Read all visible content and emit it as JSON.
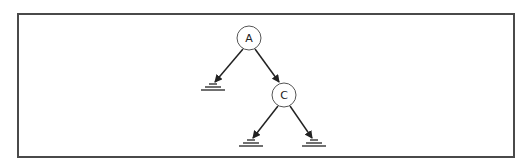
{
  "diagram": {
    "type": "binary-tree",
    "colors": {
      "stroke": "#222222",
      "frame": "#4a4a4a",
      "background": "#ffffff"
    },
    "nodes": [
      {
        "id": "A",
        "label": "A",
        "cx": 249,
        "cy": 38
      },
      {
        "id": "C",
        "label": "C",
        "cx": 284,
        "cy": 95
      }
    ],
    "null_pointers": [
      {
        "id": "A-left",
        "x": 213,
        "y": 87
      },
      {
        "id": "C-left",
        "x": 251,
        "y": 143
      },
      {
        "id": "C-right",
        "x": 314,
        "y": 143
      }
    ],
    "edges": [
      {
        "from": "A",
        "to": "A-left"
      },
      {
        "from": "A",
        "to": "C"
      },
      {
        "from": "C",
        "to": "C-left"
      },
      {
        "from": "C",
        "to": "C-right"
      }
    ]
  }
}
